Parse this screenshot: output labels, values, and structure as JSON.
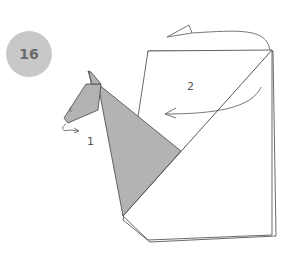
{
  "step": {
    "number": "16"
  },
  "labels": {
    "fold1": "1",
    "fold2": "2"
  },
  "colors": {
    "paper_colored": "#b3b3b3",
    "paper_white": "#ffffff",
    "badge": "#c8c8c8",
    "line": "#444444"
  },
  "icons": {
    "arrow1": "curved-arrow",
    "arrow2": "curved-arrow",
    "arrow3": "fold-behind-arrow"
  }
}
